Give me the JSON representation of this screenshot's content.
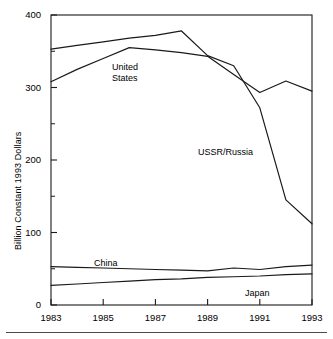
{
  "figure": {
    "ylabel": "Billion Constant 1993 Dollars",
    "xlabel": ""
  },
  "axes": {
    "y_ticks": [
      {
        "value": 400,
        "label": "400"
      },
      {
        "value": 300,
        "label": "300"
      },
      {
        "value": 200,
        "label": "200"
      },
      {
        "value": 100,
        "label": "100"
      },
      {
        "value": 0,
        "label": "0"
      }
    ],
    "y_minor_ticks": [
      350,
      250,
      150,
      50
    ],
    "x_ticks": [
      {
        "value": 1983,
        "label": "1983"
      },
      {
        "value": 1985,
        "label": "1985"
      },
      {
        "value": 1987,
        "label": "1987"
      },
      {
        "value": 1989,
        "label": "1989"
      },
      {
        "value": 1991,
        "label": "1991"
      },
      {
        "value": 1993,
        "label": "1993"
      }
    ]
  },
  "series_labels": {
    "united_states_line1": "United",
    "united_states_line2": "States",
    "ussr_russia": "USSR/Russia",
    "china": "China",
    "japan": "Japan"
  },
  "chart_data": {
    "type": "line",
    "title": "",
    "xlabel": "",
    "ylabel": "Billion Constant 1993 Dollars",
    "xlim": [
      1983,
      1993
    ],
    "ylim": [
      0,
      400
    ],
    "grid": false,
    "legend": "inline-annotations",
    "x": [
      1983,
      1984,
      1985,
      1986,
      1987,
      1988,
      1989,
      1990,
      1991,
      1992,
      1993
    ],
    "series": [
      {
        "name": "USSR/Russia",
        "color": "#1a1a1a",
        "values": [
          353,
          358,
          363,
          368,
          372,
          378,
          344,
          330,
          272,
          145,
          112
        ]
      },
      {
        "name": "United States",
        "color": "#1a1a1a",
        "values": [
          308,
          325,
          340,
          355,
          352,
          348,
          343,
          318,
          293,
          309,
          295
        ]
      },
      {
        "name": "China",
        "color": "#1a1a1a",
        "values": [
          53,
          52,
          51,
          50,
          49,
          48,
          47,
          51,
          49,
          53,
          55
        ]
      },
      {
        "name": "Japan",
        "color": "#1a1a1a",
        "values": [
          27,
          29,
          31,
          33,
          35,
          36,
          38,
          39,
          40,
          42,
          43
        ]
      }
    ]
  },
  "colors": {
    "line": "#1a1a1a",
    "axis": "#1a1a1a",
    "background": "#ffffff",
    "rule": "#4a4a4a"
  }
}
